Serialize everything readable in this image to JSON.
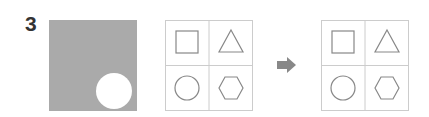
{
  "puzzle": {
    "number": "3",
    "colors": {
      "panel": "#aaaaaa",
      "line": "#999999",
      "shape": "#888888",
      "arrow": "#888888",
      "text": "#333333"
    },
    "left_panel": {
      "shape": "gray-square-with-circle-hole"
    },
    "before_grid": {
      "cells": [
        "square",
        "triangle",
        "circle",
        "hexagon"
      ]
    },
    "after_grid": {
      "cells": [
        "square",
        "triangle",
        "circle",
        "hexagon"
      ]
    },
    "arrow": "right-arrow-icon"
  }
}
